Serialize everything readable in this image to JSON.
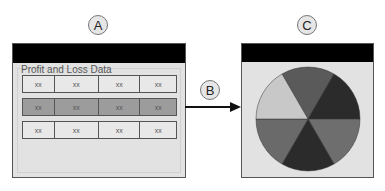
{
  "callouts": {
    "a": "A",
    "b": "B",
    "c": "C"
  },
  "source_window": {
    "label": "Profit and Loss Data",
    "rows": [
      {
        "cells": [
          "xx",
          "xx",
          "xx",
          "xx"
        ],
        "highlighted": false
      },
      {
        "cells": [
          "xx",
          "xx",
          "xx",
          "xx"
        ],
        "highlighted": true
      },
      {
        "cells": [
          "xx",
          "xx",
          "xx",
          "xx"
        ],
        "highlighted": false
      }
    ]
  },
  "chart_window": {
    "chart_type": "pie",
    "slice_colors": [
      "#5a5a5a",
      "#2b2b2b",
      "#6e6e6e",
      "#2b2b2b",
      "#6a6a6a",
      "#c8c8c8"
    ]
  },
  "colors": {
    "titlebar": "#000000",
    "window_bg": "#e2e2e2",
    "highlight_row": "#9c9c9c"
  }
}
